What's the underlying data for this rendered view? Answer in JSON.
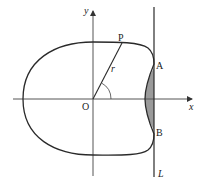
{
  "diagram": {
    "type": "polar curve with vertical line",
    "labels": {
      "origin": "O",
      "x_axis": "x",
      "y_axis": "y",
      "point_p": "P",
      "point_a": "A",
      "point_b": "B",
      "radius": "r",
      "line": "L"
    },
    "colors": {
      "stroke": "#2a2a2a",
      "axis": "#555555",
      "shaded_region": "#9a9a9a",
      "background": "#ffffff"
    }
  }
}
